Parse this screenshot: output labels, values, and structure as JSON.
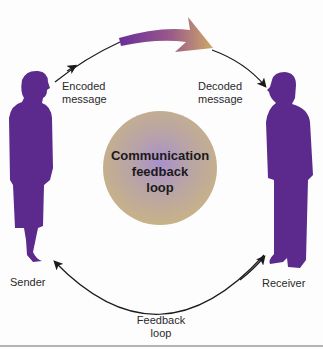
{
  "diagram": {
    "title": "Communication feedback loop",
    "center_circle": {
      "line1": "Communication",
      "line2": "feedback",
      "line3": "loop"
    },
    "nodes": {
      "sender": {
        "label": "Sender"
      },
      "receiver": {
        "label": "Receiver"
      }
    },
    "edges": {
      "encoded": {
        "line1": "Encoded",
        "line2": "message"
      },
      "decoded": {
        "line1": "Decoded",
        "line2": "message"
      },
      "feedback": {
        "line1": "Feedback",
        "line2": "loop"
      }
    },
    "colors": {
      "figure": "#5b2a8c",
      "circle_outer": "#c9b48a",
      "circle_inner": "#a98fc8",
      "arrow_start": "#6a2d9a",
      "arrow_end": "#c9a86a",
      "line": "#1a1a1a"
    }
  }
}
